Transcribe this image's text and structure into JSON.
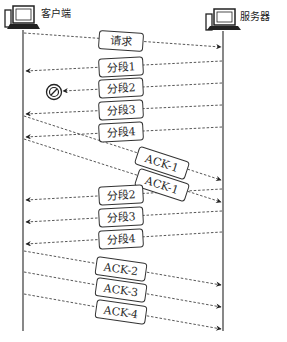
{
  "diagram": {
    "type": "sequence-diagram",
    "participants": [
      {
        "id": "client",
        "label": "客户端",
        "icon": "computer-icon"
      },
      {
        "id": "server",
        "label": "服务器",
        "icon": "computer-icon"
      }
    ],
    "messages": [
      {
        "label": "请求",
        "from": "client",
        "to": "server"
      },
      {
        "label": "分段1",
        "from": "server",
        "to": "client"
      },
      {
        "label": "分段2",
        "from": "server",
        "to": "client",
        "lost": true
      },
      {
        "label": "分段3",
        "from": "server",
        "to": "client"
      },
      {
        "label": "分段4",
        "from": "server",
        "to": "client"
      },
      {
        "label": "ACK-1",
        "from": "client",
        "to": "server"
      },
      {
        "label": "ACK-1",
        "from": "client",
        "to": "server"
      },
      {
        "label": "分段2",
        "from": "server",
        "to": "client"
      },
      {
        "label": "分段3",
        "from": "server",
        "to": "client"
      },
      {
        "label": "分段4",
        "from": "server",
        "to": "client"
      },
      {
        "label": "ACK-2",
        "from": "client",
        "to": "server"
      },
      {
        "label": "ACK-3",
        "from": "client",
        "to": "server"
      },
      {
        "label": "ACK-4",
        "from": "client",
        "to": "server"
      }
    ],
    "lost_marker_icon": "prohibited-icon"
  }
}
